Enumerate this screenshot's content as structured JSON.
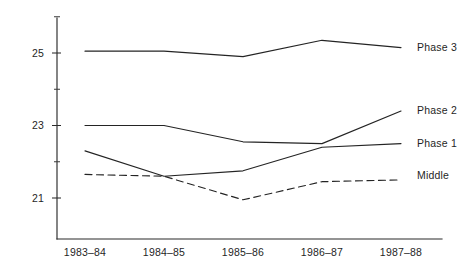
{
  "chart_data": {
    "type": "line",
    "title": "",
    "subtitle": "",
    "xlabel": "",
    "ylabel": "",
    "categories": [
      "1983-84",
      "1984-85",
      "1985-86",
      "1986-87",
      "1987-88"
    ],
    "x_tick_labels": [
      "1983–84",
      "1984–85",
      "1985–86",
      "1986–87",
      "1987–88"
    ],
    "y_tick_labels": [
      "21",
      "23",
      "25"
    ],
    "y_tick_values": [
      21,
      23,
      25
    ],
    "y_minor_tick_values": [
      22,
      24,
      26
    ],
    "ylim": [
      20.2,
      26.2
    ],
    "xlim": [
      0,
      4
    ],
    "grid": false,
    "legend_position": "right-of-lines",
    "series": [
      {
        "name": "Phase 3",
        "label": "Phase 3",
        "style": "solid",
        "color": "#242424",
        "values": [
          25.05,
          25.05,
          24.9,
          25.35,
          25.15
        ],
        "label_y": 25.17
      },
      {
        "name": "Phase 2",
        "label": "Phase 2",
        "style": "solid",
        "color": "#242424",
        "values": [
          23.0,
          23.0,
          22.55,
          22.5,
          23.4
        ],
        "label_y": 23.42
      },
      {
        "name": "Phase 1",
        "label": "Phase 1",
        "style": "solid",
        "color": "#242424",
        "values": [
          22.3,
          21.6,
          21.75,
          22.4,
          22.5
        ],
        "label_y": 22.5
      },
      {
        "name": "Middle",
        "label": "Middle",
        "style": "dashed",
        "color": "#242424",
        "values": [
          21.65,
          21.6,
          20.95,
          21.45,
          21.5
        ],
        "label_y": 21.63
      }
    ]
  },
  "axes": {
    "y_axis_name": "value-axis",
    "x_axis_name": "year-axis"
  }
}
